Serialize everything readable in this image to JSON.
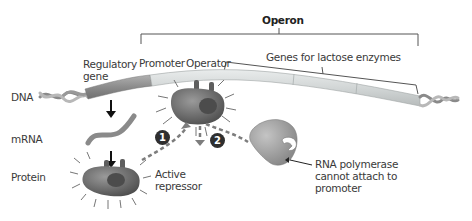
{
  "diagram": {
    "title": "Operon",
    "labels": {
      "regulatory_gene_line1": "Regulatory",
      "regulatory_gene_line2": "gene",
      "promoter": "Promoter",
      "operator": "Operator",
      "genes_for_lactose_enzymes": "Genes for lactose enzymes",
      "dna": "DNA",
      "mrna": "mRNA",
      "protein": "Protein",
      "active_repressor_line1": "Active",
      "active_repressor_line2": "repressor",
      "rna_polymerase_line1": "RNA polymerase",
      "rna_polymerase_line2": "cannot attach to",
      "rna_polymerase_line3": "promoter"
    },
    "steps": [
      "1",
      "2"
    ],
    "colors": {
      "dna_dark": "#8a8a8a",
      "dna_light": "#d9dcdc",
      "repressor": "#6e6e6e",
      "polymerase": "#9a9a9a",
      "arrow_dash": "#7d7d7d",
      "step_badge": "#2f2f2f",
      "text": "#3a3a3a"
    }
  }
}
